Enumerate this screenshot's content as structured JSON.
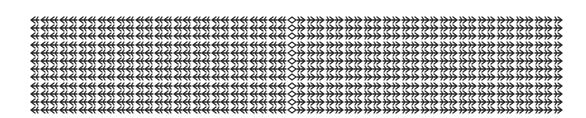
{
  "pattern": {
    "description": "Grid of arrow-like glyphs: left half points left, center column diamond, right half points right",
    "rows": 12,
    "cols": 56,
    "center_col": 27,
    "pitch_x": 9.5,
    "pitch_y": 8.2,
    "color": "#2a2a2a",
    "background": "#ffffff"
  }
}
